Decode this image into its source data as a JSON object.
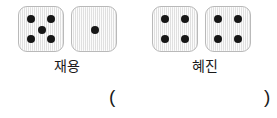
{
  "worksheet": {
    "players": [
      {
        "name_label": "재용",
        "dice": [
          {
            "face_value": 5,
            "pips": [
              "top-left",
              "top-right",
              "center",
              "bottom-left",
              "bottom-right"
            ]
          },
          {
            "face_value": 1,
            "pips": [
              "center"
            ]
          }
        ]
      },
      {
        "name_label": "혜진",
        "dice": [
          {
            "face_value": 4,
            "pips": [
              "top-left",
              "top-right",
              "bottom-left",
              "bottom-right"
            ]
          },
          {
            "face_value": 4,
            "pips": [
              "top-left",
              "top-right",
              "bottom-left",
              "bottom-right"
            ]
          }
        ]
      }
    ],
    "answer": {
      "open_paren": "(",
      "close_paren": ")",
      "value": ""
    },
    "colors": {
      "die_face": "#e9e9e9",
      "die_border": "#b9b9b9",
      "pip": "#161616",
      "text": "#1a1a1a",
      "background": "#ffffff"
    }
  }
}
